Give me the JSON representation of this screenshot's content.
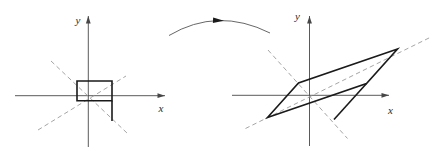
{
  "colors": {
    "background": "#ffffff",
    "shape": "#1a1a1a",
    "axis": "#474747",
    "dashed": "#9b9b9b",
    "arc": "#565656",
    "label": "#2b2b2b"
  },
  "left_plot": {
    "axis_labels": {
      "x": "x",
      "y": "y"
    },
    "x_axis": [
      15,
      95.7,
      165,
      95.7
    ],
    "y_axis": [
      88.3,
      147,
      88.3,
      16
    ],
    "x_label": {
      "x": 161,
      "y": 111.5
    },
    "y_label": {
      "x": 78,
      "y": 23.5
    },
    "shape_points": "77,81 112,81 112,100.7 77,100.7",
    "extension": [
      112,
      100.7,
      112,
      121
    ],
    "dashed": [
      [
        51,
        61,
        127,
        133
      ],
      [
        38,
        130,
        126,
        76
      ]
    ]
  },
  "right_plot": {
    "axis_labels": {
      "x": "x",
      "y": "y"
    },
    "x_axis": [
      232,
      95.3,
      389,
      95.3
    ],
    "y_axis": [
      309.5,
      146,
      309.5,
      16
    ],
    "x_label": {
      "x": 390.5,
      "y": 113.5
    },
    "y_label": {
      "x": 297.5,
      "y": 20
    },
    "shape_points": "267.5,117.5 298.5,83 397.5,49 366.5,83.5",
    "extension": [
      366.5,
      83.5,
      334,
      119.5
    ],
    "dashed": [
      [
        268,
        50,
        347.5,
        138.5
      ],
      [
        245.5,
        128.5,
        431,
        37
      ]
    ]
  },
  "transform_arrow": {
    "path_from": [
      169,
      35.5
    ],
    "ctrl": [
      217.5,
      6.8
    ],
    "path_to": [
      270,
      33
    ],
    "head_tip": [
      224,
      20.8
    ],
    "head_dir": [
      0.999,
      0.045
    ]
  }
}
